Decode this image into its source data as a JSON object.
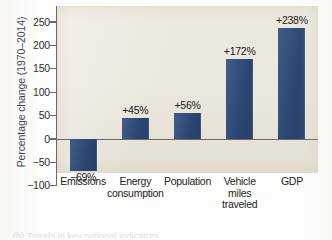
{
  "chart_data": {
    "type": "bar",
    "title": "",
    "subtitle": "",
    "xlabel": "",
    "ylabel": "Percentage change (1970–2014)",
    "ylim": [
      -100,
      275
    ],
    "yticks": [
      -100,
      -50,
      0,
      50,
      100,
      150,
      200,
      250
    ],
    "ytick_labels": [
      "−100",
      "−50",
      "0",
      "50",
      "100",
      "150",
      "200",
      "250"
    ],
    "grid": false,
    "legend": null,
    "zero_line": true,
    "bar_color": "#2d4a7a",
    "panel_color": "#ece8dd",
    "categories": [
      "Emissions",
      "Energy consumption",
      "Population",
      "Vehicle miles traveled",
      "GDP"
    ],
    "category_label_lines": [
      [
        "Emissions"
      ],
      [
        "Energy",
        "consumption"
      ],
      [
        "Population"
      ],
      [
        "Vehicle",
        "miles",
        "traveled"
      ],
      [
        "GDP"
      ]
    ],
    "values": [
      -69,
      45,
      56,
      172,
      238
    ],
    "data_labels": [
      "−69%",
      "+45%",
      "+56%",
      "+172%",
      "+238%"
    ],
    "data_label_position": [
      "below",
      "above",
      "above",
      "above",
      "above"
    ]
  },
  "caption": {
    "sliver_text": "(b) Trends in key national indicators"
  }
}
